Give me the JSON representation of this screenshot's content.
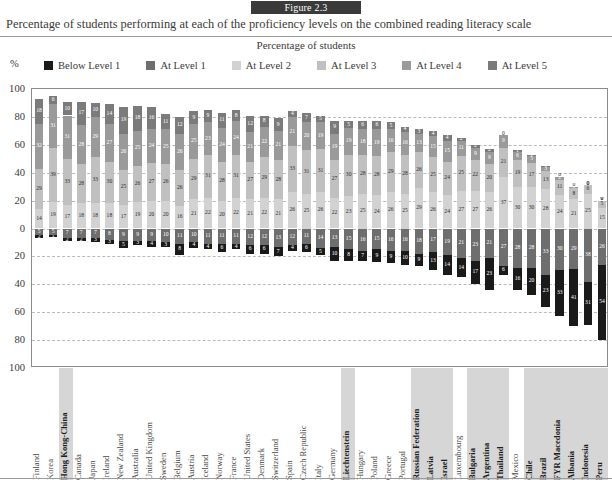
{
  "figure": {
    "badge": "Figure 2.3",
    "title": "Percentage of students performing at each of the proficiency levels on the combined reading literacy scale",
    "axis_title": "Percentage of students",
    "percent_symbol": "%"
  },
  "legend": {
    "items": [
      {
        "label": "Below Level 1",
        "color": "#1a1a1a"
      },
      {
        "label": "At Level 1",
        "color": "#6e6e6e"
      },
      {
        "label": "At Level 2",
        "color": "#d2d2d2"
      },
      {
        "label": "At Level 3",
        "color": "#c0c0c0"
      },
      {
        "label": "At Level 4",
        "color": "#9a9a9a"
      },
      {
        "label": "At Level 5",
        "color": "#7b7b7b"
      }
    ]
  },
  "chart_data": {
    "type": "bar",
    "title": "Percentage of students performing at each of the proficiency levels on the combined reading literacy scale",
    "subtitle": "Figure 2.3",
    "xlabel": "",
    "ylabel": "Percentage of students",
    "ylim": [
      -100,
      100
    ],
    "grid": true,
    "stacked": true,
    "diverging": true,
    "legend_position": "top",
    "ytick_labels": [
      "100",
      "80",
      "60",
      "40",
      "20",
      "0",
      "20",
      "40",
      "60",
      "80",
      "100"
    ],
    "ytick_values": [
      100,
      80,
      60,
      40,
      20,
      0,
      -20,
      -40,
      -60,
      -80,
      -100
    ],
    "note": "Bars above zero show Levels 2-5; bars below zero show Level 1 and Below Level 1.",
    "series": [
      {
        "name": "Below Level 1",
        "color": "#1a1a1a",
        "direction": "down"
      },
      {
        "name": "At Level 1",
        "color": "#6e6e6e",
        "direction": "down"
      },
      {
        "name": "At Level 2",
        "color": "#d2d2d2",
        "direction": "up"
      },
      {
        "name": "At Level 3",
        "color": "#c0c0c0",
        "direction": "up"
      },
      {
        "name": "At Level 4",
        "color": "#9a9a9a",
        "direction": "up"
      },
      {
        "name": "At Level 5",
        "color": "#7b7b7b",
        "direction": "up"
      }
    ],
    "categories": [
      "Finland",
      "Korea",
      "Hong Kong-China",
      "Canada",
      "Japan",
      "Ireland",
      "New Zealand",
      "Australia",
      "United Kingdom",
      "Sweden",
      "Belgium",
      "Austria",
      "Iceland",
      "Norway",
      "France",
      "United States",
      "Denmark",
      "Switzerland",
      "Spain",
      "Czech Republic",
      "Italy",
      "Germany",
      "Liechtenstein",
      "Poland",
      "Hungary",
      "Greece",
      "Portugal",
      "Russian Federation",
      "Latvia",
      "Israel",
      "Luxembourg",
      "Bulgaria",
      "Argentina",
      "Thailand",
      "Mexico",
      "Chile",
      "Brazil",
      "FYR Macedonia",
      "Albania",
      "Indonesia",
      "Peru"
    ],
    "partner_countries": [
      "Hong Kong-China",
      "Liechtenstein",
      "Russian Federation",
      "Latvia",
      "Israel",
      "Bulgaria",
      "Argentina",
      "Thailand",
      "Chile",
      "Brazil",
      "FYR Macedonia",
      "Albania",
      "Indonesia",
      "Peru"
    ],
    "data": [
      {
        "country": "Finland",
        "below1": 2,
        "level1": 5,
        "level2": 14,
        "level3": 29,
        "level4": 32,
        "level5": 18
      },
      {
        "country": "Korea",
        "below1": 1,
        "level1": 5,
        "level2": 19,
        "level3": 39,
        "level4": 31,
        "level5": 6
      },
      {
        "country": "Hong Kong-China",
        "below1": 2,
        "level1": 7,
        "level2": 17,
        "level3": 33,
        "level4": 31,
        "level5": 10
      },
      {
        "country": "Canada",
        "below1": 2,
        "level1": 7,
        "level2": 18,
        "level3": 28,
        "level4": 28,
        "level5": 17
      },
      {
        "country": "Japan",
        "below1": 3,
        "level1": 7,
        "level2": 18,
        "level3": 33,
        "level4": 29,
        "level5": 10
      },
      {
        "country": "Ireland",
        "below1": 3,
        "level1": 8,
        "level2": 18,
        "level3": 30,
        "level4": 27,
        "level5": 14
      },
      {
        "country": "New Zealand",
        "below1": 5,
        "level1": 9,
        "level2": 17,
        "level3": 25,
        "level4": 26,
        "level5": 19
      },
      {
        "country": "Australia",
        "below1": 3,
        "level1": 9,
        "level2": 19,
        "level3": 26,
        "level4": 25,
        "level5": 18
      },
      {
        "country": "United Kingdom",
        "below1": 4,
        "level1": 9,
        "level2": 20,
        "level3": 27,
        "level4": 24,
        "level5": 16
      },
      {
        "country": "Sweden",
        "below1": 3,
        "level1": 10,
        "level2": 20,
        "level3": 26,
        "level4": 25,
        "level5": 11
      },
      {
        "country": "Belgium",
        "below1": 8,
        "level1": 11,
        "level2": 16,
        "level3": 26,
        "level4": 26,
        "level5": 12
      },
      {
        "country": "Austria",
        "below1": 4,
        "level1": 10,
        "level2": 21,
        "level3": 29,
        "level4": 25,
        "level5": 9
      },
      {
        "country": "Iceland",
        "below1": 4,
        "level1": 11,
        "level2": 22,
        "level3": 31,
        "level4": 23,
        "level5": 9
      },
      {
        "country": "Norway",
        "below1": 6,
        "level1": 11,
        "level2": 20,
        "level3": 28,
        "level4": 24,
        "level5": 11
      },
      {
        "country": "France",
        "below1": 4,
        "level1": 11,
        "level2": 22,
        "level3": 31,
        "level4": 24,
        "level5": 8
      },
      {
        "country": "United States",
        "below1": 6,
        "level1": 12,
        "level2": 21,
        "level3": 27,
        "level4": 21,
        "level5": 12
      },
      {
        "country": "Denmark",
        "below1": 6,
        "level1": 12,
        "level2": 22,
        "level3": 29,
        "level4": 22,
        "level5": 8
      },
      {
        "country": "Switzerland",
        "below1": 7,
        "level1": 13,
        "level2": 21,
        "level3": 28,
        "level4": 21,
        "level5": 9
      },
      {
        "country": "Spain",
        "below1": 4,
        "level1": 12,
        "level2": 26,
        "level3": 33,
        "level4": 21,
        "level5": 4
      },
      {
        "country": "Czech Republic",
        "below1": 6,
        "level1": 11,
        "level2": 25,
        "level3": 31,
        "level4": 20,
        "level5": 7
      },
      {
        "country": "Italy",
        "below1": 5,
        "level1": 14,
        "level2": 26,
        "level3": 31,
        "level4": 19,
        "level5": 5
      },
      {
        "country": "Germany",
        "below1": 10,
        "level1": 13,
        "level2": 22,
        "level3": 27,
        "level4": 19,
        "level5": 9
      },
      {
        "country": "Liechtenstein",
        "below1": 8,
        "level1": 15,
        "level2": 23,
        "level3": 30,
        "level4": 19,
        "level5": 5
      },
      {
        "country": "Hungary",
        "below1": 7,
        "level1": 16,
        "level2": 25,
        "level3": 28,
        "level4": 18,
        "level5": 6
      },
      {
        "country": "Poland",
        "below1": 9,
        "level1": 15,
        "level2": 24,
        "level3": 28,
        "level4": 19,
        "level5": 6
      },
      {
        "country": "Greece",
        "below1": 9,
        "level1": 16,
        "level2": 26,
        "level3": 29,
        "level4": 16,
        "level5": 5
      },
      {
        "country": "Portugal",
        "below1": 10,
        "level1": 16,
        "level2": 25,
        "level3": 28,
        "level4": 16,
        "level5": 4
      },
      {
        "country": "Russian Federation",
        "below1": 9,
        "level1": 18,
        "level2": 29,
        "level3": 26,
        "level4": 13,
        "level5": 3
      },
      {
        "country": "Latvia",
        "below1": 13,
        "level1": 17,
        "level2": 26,
        "level3": 25,
        "level4": 15,
        "level5": 4
      },
      {
        "country": "Israel",
        "below1": 14,
        "level1": 19,
        "level2": 24,
        "level3": 24,
        "level4": 15,
        "level5": 4
      },
      {
        "country": "Luxembourg",
        "below1": 14,
        "level1": 21,
        "level2": 27,
        "level3": 25,
        "level4": 11,
        "level5": 2
      },
      {
        "country": "Bulgaria",
        "below1": 17,
        "level1": 23,
        "level2": 27,
        "level3": 22,
        "level4": 9,
        "level5": 2
      },
      {
        "country": "Argentina",
        "below1": 23,
        "level1": 21,
        "level2": 26,
        "level3": 20,
        "level4": 9,
        "level5": 2
      },
      {
        "country": "Thailand",
        "below1": 6,
        "level1": 27,
        "level2": 37,
        "level3": 21,
        "level4": 9,
        "level5": 0
      },
      {
        "country": "Mexico",
        "below1": 16,
        "level1": 28,
        "level2": 30,
        "level3": 19,
        "level4": 6,
        "level5": 1
      },
      {
        "country": "Chile",
        "below1": 20,
        "level1": 28,
        "level2": 30,
        "level3": 17,
        "level4": 5,
        "level5": 1
      },
      {
        "country": "Brazil",
        "below1": 23,
        "level1": 33,
        "level2": 28,
        "level3": 13,
        "level4": 3,
        "level5": 1
      },
      {
        "country": "FYR Macedonia",
        "below1": 33,
        "level1": 30,
        "level2": 24,
        "level3": 11,
        "level4": 2,
        "level5": 0
      },
      {
        "country": "Albania",
        "below1": 41,
        "level1": 29,
        "level2": 21,
        "level3": 8,
        "level4": 1,
        "level5": 0
      },
      {
        "country": "Indonesia",
        "below1": 31,
        "level1": 38,
        "level2": 25,
        "level3": 6,
        "level4": 0,
        "level5": 0
      },
      {
        "country": "Peru",
        "below1": 54,
        "level1": 26,
        "level2": 15,
        "level3": 5,
        "level4": 0,
        "level5": 0
      }
    ]
  }
}
